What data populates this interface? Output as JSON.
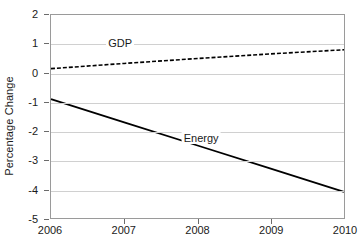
{
  "chart_data": {
    "type": "line",
    "title": "",
    "xlabel": "",
    "ylabel": "Percentage Change",
    "x": [
      2006,
      2007,
      2008,
      2009,
      2010
    ],
    "xlim": [
      2006,
      2010
    ],
    "ylim": [
      -5,
      2
    ],
    "y_ticks": [
      2,
      1,
      0,
      -1,
      -2,
      -3,
      -4,
      -5
    ],
    "x_tick_labels": [
      "2006",
      "2007",
      "2008",
      "2009",
      "2010"
    ],
    "y_tick_labels": [
      "2",
      "1",
      "0",
      "-1",
      "-2",
      "-3",
      "-4",
      "-5"
    ],
    "grid": true,
    "legend_position": "inline-annotation",
    "series": [
      {
        "name": "GDP",
        "style": "dashed",
        "color": "#000000",
        "values": [
          0.15,
          0.33,
          0.5,
          0.66,
          0.8
        ],
        "label_x": 2006.95,
        "label_y": 1.0
      },
      {
        "name": "Energy",
        "style": "solid",
        "color": "#000000",
        "values": [
          -0.9,
          -1.7,
          -2.5,
          -3.3,
          -4.1
        ],
        "label_x": 2008.05,
        "label_y": -2.25
      }
    ]
  },
  "axes": {
    "y_title": "Percentage Change"
  }
}
